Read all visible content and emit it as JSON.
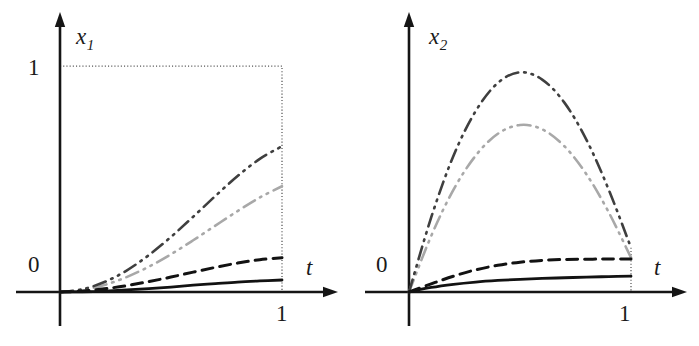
{
  "figure": {
    "background": "#ffffff",
    "width": 699,
    "height": 346
  },
  "panels": [
    {
      "id": "left",
      "ylabel": "x",
      "ylabel_sub": "1",
      "xlabel": "t",
      "y_tick_label": "1",
      "origin_label": "0",
      "x_tick_label": "1",
      "has_y_guide": true
    },
    {
      "id": "right",
      "ylabel": "x",
      "ylabel_sub": "2",
      "xlabel": "t",
      "y_tick_label": "",
      "origin_label": "0",
      "x_tick_label": "1",
      "has_y_guide": false
    }
  ],
  "chart_data": [
    {
      "type": "line",
      "title": "",
      "xlabel": "t",
      "ylabel": "x_1",
      "xlim": [
        0,
        1.24
      ],
      "ylim": [
        0,
        1.17
      ],
      "xticks": [
        1
      ],
      "xticklabels": [
        "1"
      ],
      "yticks": [
        0,
        1
      ],
      "yticklabels": [
        "0",
        "1"
      ],
      "grid": false,
      "legend": "none",
      "annotations": [
        "dotted guide box from (0,1) to (1,1) to (1,0)"
      ],
      "x": [
        0,
        0.1,
        0.2,
        0.3,
        0.4,
        0.5,
        0.6,
        0.7,
        0.8,
        0.9,
        1.0
      ],
      "series": [
        {
          "name": "curve-dark-dashdotdot",
          "color": "#3f3f3f",
          "style": "dash-dot-dot",
          "width": 2.6,
          "values": [
            0.0,
            0.012,
            0.044,
            0.095,
            0.163,
            0.244,
            0.333,
            0.425,
            0.513,
            0.589,
            0.645
          ]
        },
        {
          "name": "curve-gray-dashdotdot",
          "color": "#a8a8a8",
          "style": "dash-dot-dot",
          "width": 2.6,
          "values": [
            0.0,
            0.009,
            0.031,
            0.066,
            0.112,
            0.167,
            0.229,
            0.294,
            0.358,
            0.418,
            0.468
          ]
        },
        {
          "name": "curve-black-dashed",
          "color": "#121212",
          "style": "dashed",
          "width": 3.0,
          "values": [
            0.0,
            0.004,
            0.014,
            0.028,
            0.046,
            0.066,
            0.088,
            0.109,
            0.128,
            0.143,
            0.152
          ]
        },
        {
          "name": "curve-black-solid",
          "color": "#121212",
          "style": "solid",
          "width": 2.8,
          "values": [
            0.0,
            0.001,
            0.004,
            0.009,
            0.015,
            0.022,
            0.03,
            0.037,
            0.044,
            0.049,
            0.053
          ]
        }
      ]
    },
    {
      "type": "line",
      "title": "",
      "xlabel": "t",
      "ylabel": "x_2",
      "xlim": [
        0,
        1.24
      ],
      "ylim": [
        0,
        1.17
      ],
      "xticks": [
        1
      ],
      "xticklabels": [
        "1"
      ],
      "yticks": [
        0
      ],
      "yticklabels": [
        "0"
      ],
      "grid": false,
      "legend": "none",
      "annotations": [
        "dotted drop line at t=1 from curve values down to axis"
      ],
      "x": [
        0,
        0.1,
        0.2,
        0.3,
        0.4,
        0.5,
        0.6,
        0.7,
        0.8,
        0.9,
        1.0
      ],
      "series": [
        {
          "name": "curve-dark-dashdotdot",
          "color": "#3f3f3f",
          "style": "dash-dot-dot",
          "width": 2.6,
          "values": [
            0.0,
            0.33,
            0.602,
            0.8,
            0.925,
            0.972,
            0.94,
            0.838,
            0.672,
            0.452,
            0.196
          ]
        },
        {
          "name": "curve-gray-dashdotdot",
          "color": "#a8a8a8",
          "style": "dash-dot-dot",
          "width": 2.6,
          "values": [
            0.0,
            0.248,
            0.452,
            0.603,
            0.7,
            0.739,
            0.72,
            0.645,
            0.52,
            0.352,
            0.152
          ]
        },
        {
          "name": "curve-black-dashed",
          "color": "#121212",
          "style": "dashed",
          "width": 3.0,
          "values": [
            0.0,
            0.036,
            0.07,
            0.098,
            0.118,
            0.132,
            0.14,
            0.144,
            0.145,
            0.146,
            0.146
          ]
        },
        {
          "name": "curve-black-solid",
          "color": "#121212",
          "style": "solid",
          "width": 2.8,
          "values": [
            0.0,
            0.02,
            0.034,
            0.044,
            0.051,
            0.056,
            0.06,
            0.063,
            0.066,
            0.068,
            0.07
          ]
        }
      ]
    }
  ]
}
